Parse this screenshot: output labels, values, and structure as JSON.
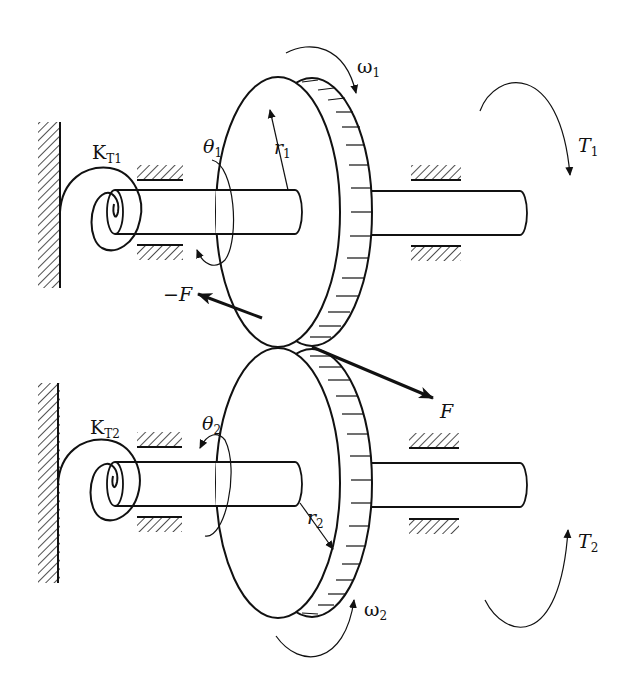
{
  "diagram": {
    "colors": {
      "ink": "#111111",
      "background": "#ffffff"
    },
    "labels": {
      "spring1": {
        "main": "K",
        "sub": "T1"
      },
      "spring2": {
        "main": "K",
        "sub": "T2"
      },
      "theta1": {
        "main": "θ",
        "sub": "1"
      },
      "theta2": {
        "main": "θ",
        "sub": "2"
      },
      "r1": {
        "main": "r",
        "sub": "1"
      },
      "r2": {
        "main": "r",
        "sub": "2"
      },
      "omega1": {
        "main": "ω",
        "sub": "1"
      },
      "omega2": {
        "main": "ω",
        "sub": "2"
      },
      "torque1": {
        "main": "T",
        "sub": "1"
      },
      "torque2": {
        "main": "T",
        "sub": "2"
      },
      "force_pos": "F",
      "force_neg": "−F"
    },
    "components": [
      "fixed wall (upper)",
      "fixed wall (lower)",
      "torsional spring K_T1",
      "torsional spring K_T2",
      "gear 1",
      "gear 2",
      "shaft 1",
      "shaft 2",
      "bearings (4 per shaft)",
      "contact force pair F / −F"
    ]
  }
}
